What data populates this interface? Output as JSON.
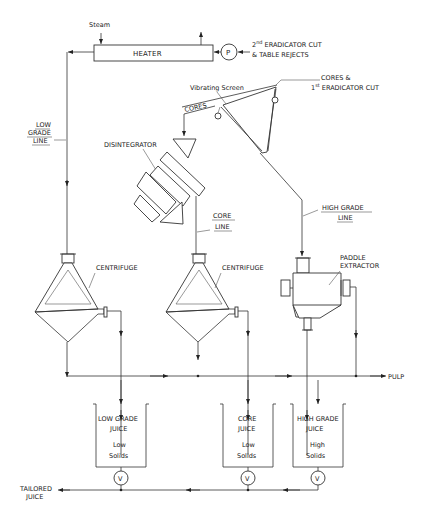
{
  "diagram": {
    "inputs": {
      "steam": "Steam",
      "eradicator_cut_2_line1": "2",
      "eradicator_cut_2_sup": "nd",
      "eradicator_cut_2_rest": " ERADICATOR CUT",
      "eradicator_cut_2_line2": "& TABLE REJECTS",
      "cores_eradicator_line1": "CORES  &",
      "cores_eradicator_line2_num": "1",
      "cores_eradicator_line2_sup": "st",
      "cores_eradicator_line2_rest": " ERADICATOR CUT"
    },
    "equipment": {
      "heater": "HEATER",
      "pump": "P",
      "vibrating_screen": "Vibrating Screen",
      "cores_label": "CORES",
      "disintegrator": "DISINTEGRATOR",
      "centrifuge_1": "CENTRIFUGE",
      "centrifuge_2": "CENTRIFUGE",
      "paddle_extractor_line1": "PADDLE",
      "paddle_extractor_line2": "EXTRACTOR"
    },
    "lines": {
      "low_grade_1": "LOW",
      "low_grade_2": "GRADE",
      "low_grade_3": "LINE",
      "core_1": "CORE",
      "core_2": "LINE",
      "high_grade_1": "HIGH GRADE",
      "high_grade_2": "LINE"
    },
    "outputs": {
      "pulp": "PULP",
      "tailored_1": "TAILORED",
      "tailored_2": "JUICE"
    },
    "tanks": [
      {
        "name_1": "LOW GRADE",
        "name_2": "JUICE",
        "solids_1": "Low",
        "solids_2": "Solids",
        "valve": "V"
      },
      {
        "name_1": "CORE",
        "name_2": "JUICE",
        "solids_1": "Low",
        "solids_2": "Solids",
        "valve": "V"
      },
      {
        "name_1": "HIGH GRADE",
        "name_2": "JUICE",
        "solids_1": "High",
        "solids_2": "Solids",
        "valve": "V"
      }
    ]
  }
}
